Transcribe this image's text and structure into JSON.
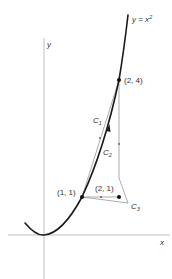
{
  "figure": {
    "curve_label": "y = x",
    "curve_label_exp": "2",
    "axes": {
      "x_label": "x",
      "y_label": "y"
    },
    "points": [
      {
        "id": "p24",
        "label": "(2, 4)"
      },
      {
        "id": "p11",
        "label": "(1, 1)"
      },
      {
        "id": "p21",
        "label": "(2, 1)"
      }
    ],
    "paths": [
      {
        "id": "C1",
        "label": "C",
        "sub": "1"
      },
      {
        "id": "C2",
        "label": "C",
        "sub": "2"
      },
      {
        "id": "C3",
        "label": "C",
        "sub": "3"
      }
    ],
    "colors": {
      "axis": "#b0b0b0",
      "curve": "#1a1a1a",
      "thin": "#888888",
      "text": "#333333"
    }
  }
}
